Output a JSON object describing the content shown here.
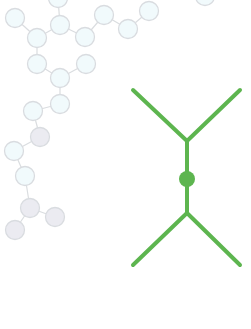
{
  "colors": {
    "background": "#ffffff",
    "node_fill_light": "#f1fafc",
    "node_fill_grey": "#ebebf1",
    "node_stroke": "#d9dce0",
    "bond_stroke": "#dadde0",
    "accent_green": "#5db54f"
  },
  "molecule": {
    "node_radius": 9.5,
    "nodes": [
      {
        "id": "d",
        "x": 58,
        "y": -2,
        "tone": "light"
      },
      {
        "id": "a",
        "x": 15,
        "y": 18,
        "tone": "light"
      },
      {
        "id": "c",
        "x": 60,
        "y": 25,
        "tone": "light"
      },
      {
        "id": "b",
        "x": 37,
        "y": 38,
        "tone": "light"
      },
      {
        "id": "e",
        "x": 85,
        "y": 37,
        "tone": "light"
      },
      {
        "id": "f",
        "x": 104,
        "y": 15,
        "tone": "light"
      },
      {
        "id": "g",
        "x": 128,
        "y": 29,
        "tone": "light"
      },
      {
        "id": "h",
        "x": 149,
        "y": 11,
        "tone": "light"
      },
      {
        "id": "i",
        "x": 205,
        "y": -4,
        "tone": "light"
      },
      {
        "id": "j",
        "x": 37,
        "y": 64,
        "tone": "light"
      },
      {
        "id": "k",
        "x": 60,
        "y": 78,
        "tone": "light"
      },
      {
        "id": "l",
        "x": 86,
        "y": 64,
        "tone": "light"
      },
      {
        "id": "m",
        "x": 60,
        "y": 104,
        "tone": "light"
      },
      {
        "id": "n",
        "x": 33,
        "y": 111,
        "tone": "light"
      },
      {
        "id": "o",
        "x": 40,
        "y": 137,
        "tone": "grey"
      },
      {
        "id": "p",
        "x": 14,
        "y": 151,
        "tone": "light"
      },
      {
        "id": "q",
        "x": 25,
        "y": 176,
        "tone": "light"
      },
      {
        "id": "r",
        "x": 30,
        "y": 208,
        "tone": "grey"
      },
      {
        "id": "s",
        "x": 55,
        "y": 217,
        "tone": "grey"
      },
      {
        "id": "t",
        "x": 15,
        "y": 230,
        "tone": "grey"
      }
    ],
    "bonds": [
      [
        "a",
        "b"
      ],
      [
        "b",
        "c"
      ],
      [
        "c",
        "d"
      ],
      [
        "c",
        "e"
      ],
      [
        "e",
        "f"
      ],
      [
        "f",
        "g"
      ],
      [
        "g",
        "h"
      ],
      [
        "b",
        "j"
      ],
      [
        "j",
        "k"
      ],
      [
        "k",
        "l"
      ],
      [
        "k",
        "m"
      ],
      [
        "m",
        "n"
      ],
      [
        "n",
        "o"
      ],
      [
        "o",
        "p"
      ],
      [
        "p",
        "q"
      ],
      [
        "q",
        "r"
      ],
      [
        "r",
        "s"
      ],
      [
        "r",
        "t"
      ]
    ]
  },
  "feynman_vertex": {
    "stroke_width": 4,
    "dot": {
      "x": 187,
      "y": 179,
      "r": 8
    },
    "lines": [
      {
        "x1": 133,
        "y1": 90,
        "x2": 187,
        "y2": 141
      },
      {
        "x1": 240,
        "y1": 90,
        "x2": 187,
        "y2": 141
      },
      {
        "x1": 187,
        "y1": 141,
        "x2": 187,
        "y2": 213
      },
      {
        "x1": 187,
        "y1": 213,
        "x2": 133,
        "y2": 265
      },
      {
        "x1": 187,
        "y1": 213,
        "x2": 240,
        "y2": 265
      }
    ]
  }
}
